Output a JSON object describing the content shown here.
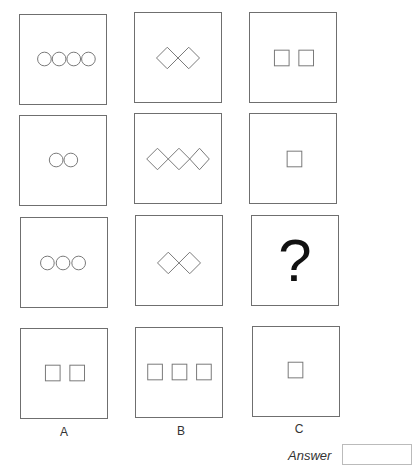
{
  "puzzle": {
    "grid": [
      [
        {
          "shape": "circle",
          "count": 4
        },
        {
          "shape": "diamond",
          "count": 2
        },
        {
          "shape": "square",
          "count": 2
        }
      ],
      [
        {
          "shape": "circle",
          "count": 2
        },
        {
          "shape": "diamond",
          "count": 3
        },
        {
          "shape": "square",
          "count": 1
        }
      ],
      [
        {
          "shape": "circle",
          "count": 3
        },
        {
          "shape": "diamond",
          "count": 2
        },
        {
          "shape": "question",
          "text": "?"
        }
      ]
    ],
    "options": [
      {
        "label": "A",
        "shape": "square",
        "count": 2
      },
      {
        "label": "B",
        "shape": "square",
        "count": 3
      },
      {
        "label": "C",
        "shape": "square",
        "count": 1
      }
    ],
    "question_mark": "?",
    "answer": {
      "label": "Answer",
      "value": ""
    }
  }
}
